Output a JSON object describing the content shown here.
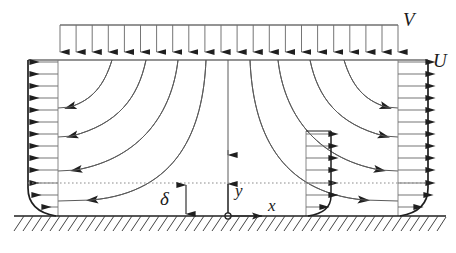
{
  "figure": {
    "type": "technical-diagram",
    "background_color": "#ffffff",
    "line_color": "#2b2b2b",
    "streamline_color": "#555555",
    "dotted_color": "#888888"
  },
  "labels": {
    "inflow_velocity": "V",
    "outflow_velocity": "U",
    "boundary_layer_thickness": "δ",
    "axis_x": "x",
    "axis_y": "y"
  },
  "geometry": {
    "ground_y": 216,
    "domain_left_x": 28,
    "domain_right_x": 428,
    "domain_top_y": 60,
    "center_x": 228,
    "delta_line_y": 183,
    "top_manifold_y": 25,
    "top_manifold_left_x": 60,
    "top_manifold_right_x": 398,
    "inner_profile_x": 325,
    "inner_profile_top_y": 131
  },
  "elements": {
    "inflow_arrow_count": 22,
    "left_profile_arrow_count": 13,
    "right_profile_arrow_count": 13,
    "inner_profile_arrow_count": 7,
    "streamlines_per_side": 4,
    "ground_hatch_count": 46,
    "has_centerline": true,
    "has_delta_dimension": true,
    "has_origin_marker": true,
    "has_dotted_delta_line": true
  },
  "annotations": {
    "inflow_label_desc": "free-stream impinging velocity V at top manifold",
    "outflow_label_desc": "outflow velocity profile U at side walls",
    "delta_desc": "boundary layer thickness delta measured from wall",
    "origin_desc": "coordinate origin at stagnation point on wall"
  }
}
